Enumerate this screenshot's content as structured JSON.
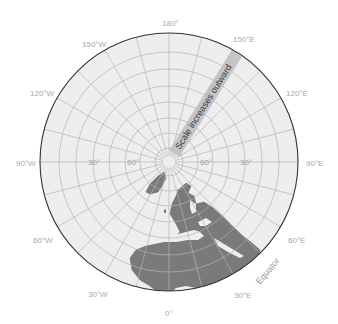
{
  "map": {
    "projection": "polar azimuthal (north pole centered)",
    "colors": {
      "ocean": "#eeeeee",
      "land": "#7a7a7a",
      "graticule": "#b4b4b4",
      "outline": "#333333",
      "band": "#bdbdbd",
      "label": "#a8a8a8"
    },
    "longitude_labels": [
      {
        "text": "180°",
        "pos": "top"
      },
      {
        "text": "150°E",
        "pos": "top-right"
      },
      {
        "text": "120°E",
        "pos": "right-upper"
      },
      {
        "text": "90°E",
        "pos": "right"
      },
      {
        "text": "60°E",
        "pos": "right-lower"
      },
      {
        "text": "30°E",
        "pos": "bottom-right"
      },
      {
        "text": "0°",
        "pos": "bottom"
      },
      {
        "text": "30°W",
        "pos": "bottom-left"
      },
      {
        "text": "60°W",
        "pos": "left-lower"
      },
      {
        "text": "90°W",
        "pos": "left"
      },
      {
        "text": "120°W",
        "pos": "left-upper"
      },
      {
        "text": "150°W",
        "pos": "top-left"
      }
    ],
    "latitude_labels": {
      "left_30": "30°",
      "left_60": "60°",
      "right_60": "60°",
      "right_30": "30°"
    },
    "band_label": "Scale increases outward",
    "equator_label": "Equator"
  }
}
